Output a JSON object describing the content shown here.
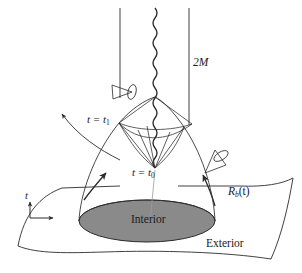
{
  "figure": {
    "background_color": "#ffffff",
    "line_color": "#2b2b2b",
    "interior_fill": "#8a8a8a"
  },
  "labels": {
    "horizon": "2M",
    "time_slice_upper_prefix": "t = t",
    "time_slice_upper_sub": "1",
    "time_slice_lower_prefix": "t = t",
    "time_slice_lower_sub": "0",
    "boundary_radius_main": "R",
    "boundary_radius_sub": "b",
    "boundary_radius_arg": "(t)",
    "interior": "Interior",
    "exterior": "Exterior",
    "time_axis": "t"
  },
  "elements": {
    "singularity": "wavy-vertical-line",
    "horizon_left": "vertical-line",
    "horizon_right": "vertical-line",
    "light_cone_left": "tilted-light-cone",
    "light_cone_right": "tilted-light-cone",
    "escaping_ray": "curved-arrow-outgoing",
    "infalling_arrow_left": "curved-arrow-up",
    "infalling_arrow_right": "curved-arrow-up",
    "collapsing_surface": "funnel",
    "exterior_sheet": "curved-plane",
    "interior_disk": "shaded-ellipse",
    "axis_marker": "t-axis-arrows"
  }
}
